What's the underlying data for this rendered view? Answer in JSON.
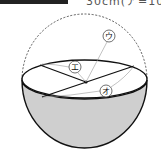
{
  "header": {
    "partial_text": "30cm(ア=10"
  },
  "diagram": {
    "labels": {
      "u": "ウ",
      "e": "エ",
      "o": "オ"
    },
    "colors": {
      "stroke": "#111111",
      "fill_bowl": "#cfcfcf",
      "dashed": "#333333",
      "leader": "#999999"
    }
  }
}
